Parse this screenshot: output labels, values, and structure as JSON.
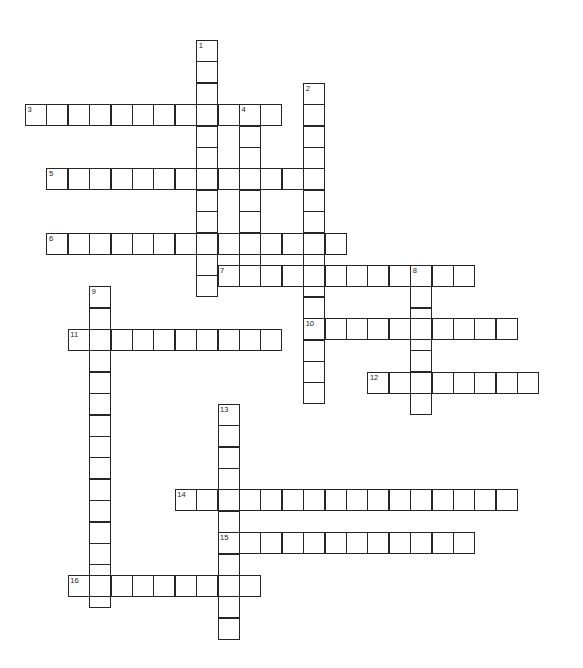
{
  "puzzle": {
    "title": "Crossword Puzzle Grid",
    "cell_size": 21.4,
    "origin_x": 25,
    "origin_y": 40,
    "grid_columns": 25,
    "grid_rows": 28,
    "cell_fill": "#ffffff",
    "cell_border": "#262626",
    "page_background": "#ffffff",
    "number_color": "#222222"
  },
  "entries": [
    {
      "number": "1",
      "direction": "down",
      "col": 8,
      "row": 0,
      "length": 12
    },
    {
      "number": "2",
      "direction": "down",
      "col": 13,
      "row": 2,
      "length": 15
    },
    {
      "number": "3",
      "direction": "across",
      "col": 0,
      "row": 3,
      "length": 12
    },
    {
      "number": "4",
      "direction": "down",
      "col": 10,
      "row": 3,
      "length": 8
    },
    {
      "number": "5",
      "direction": "across",
      "col": 1,
      "row": 6,
      "length": 13
    },
    {
      "number": "6",
      "direction": "across",
      "col": 1,
      "row": 9,
      "length": 14
    },
    {
      "number": "7",
      "direction": "across",
      "col": 9,
      "row": 10.5,
      "length": 12
    },
    {
      "number": "8",
      "direction": "down",
      "col": 18,
      "row": 10.5,
      "length": 7
    },
    {
      "number": "9",
      "direction": "down",
      "col": 3,
      "row": 11.5,
      "length": 15
    },
    {
      "number": "10",
      "direction": "across",
      "col": 13,
      "row": 13,
      "length": 10
    },
    {
      "number": "11",
      "direction": "across",
      "col": 2,
      "row": 13.5,
      "length": 10
    },
    {
      "number": "12",
      "direction": "across",
      "col": 16,
      "row": 15.5,
      "length": 8
    },
    {
      "number": "13",
      "direction": "down",
      "col": 9,
      "row": 17,
      "length": 11
    },
    {
      "number": "14",
      "direction": "across",
      "col": 7,
      "row": 21,
      "length": 16
    },
    {
      "number": "15",
      "direction": "across",
      "col": 9,
      "row": 23,
      "length": 12
    },
    {
      "number": "16",
      "direction": "across",
      "col": 2,
      "row": 25,
      "length": 9
    }
  ]
}
